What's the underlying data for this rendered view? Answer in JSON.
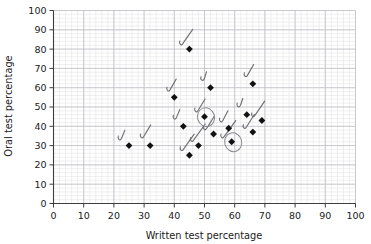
{
  "chart_data": {
    "type": "scatter",
    "title": "",
    "xlabel": "Written test percentage",
    "ylabel": "Oral test percentage",
    "xlim": [
      0,
      100
    ],
    "ylim": [
      0,
      100
    ],
    "xticks": [
      0,
      10,
      20,
      30,
      40,
      50,
      60,
      70,
      80,
      90,
      100
    ],
    "yticks": [
      0,
      10,
      20,
      30,
      40,
      50,
      60,
      70,
      80,
      90,
      100
    ],
    "grid": true,
    "grid_minor": true,
    "minor_step": 2,
    "legend": "none",
    "marker": "filled-diamond",
    "marker_color": "#111111",
    "points": [
      {
        "x": 25,
        "y": 30
      },
      {
        "x": 32,
        "y": 30
      },
      {
        "x": 40,
        "y": 55
      },
      {
        "x": 43,
        "y": 40
      },
      {
        "x": 45,
        "y": 80
      },
      {
        "x": 45,
        "y": 25
      },
      {
        "x": 48,
        "y": 30
      },
      {
        "x": 50,
        "y": 45
      },
      {
        "x": 52,
        "y": 60
      },
      {
        "x": 53,
        "y": 36
      },
      {
        "x": 58,
        "y": 39
      },
      {
        "x": 59,
        "y": 32
      },
      {
        "x": 64,
        "y": 46
      },
      {
        "x": 66,
        "y": 62
      },
      {
        "x": 66,
        "y": 37
      },
      {
        "x": 69,
        "y": 43
      }
    ],
    "annotations": {
      "description": "hand-drawn check marks beside most points; two points circled",
      "check_marks": [
        {
          "x": 25,
          "y": 30
        },
        {
          "x": 32,
          "y": 30
        },
        {
          "x": 40,
          "y": 55
        },
        {
          "x": 43,
          "y": 40
        },
        {
          "x": 45,
          "y": 80
        },
        {
          "x": 45,
          "y": 25
        },
        {
          "x": 48,
          "y": 30
        },
        {
          "x": 50,
          "y": 45
        },
        {
          "x": 52,
          "y": 60
        },
        {
          "x": 53,
          "y": 36
        },
        {
          "x": 58,
          "y": 39
        },
        {
          "x": 59,
          "y": 32
        },
        {
          "x": 64,
          "y": 46
        },
        {
          "x": 66,
          "y": 62
        },
        {
          "x": 66,
          "y": 37
        },
        {
          "x": 69,
          "y": 43
        }
      ],
      "circled": [
        {
          "x": 50,
          "y": 45
        },
        {
          "x": 59,
          "y": 32
        }
      ]
    }
  },
  "axes": {
    "x_title": "Written test percentage",
    "y_title": "Oral test percentage",
    "x_tick_labels": [
      "0",
      "10",
      "20",
      "30",
      "40",
      "50",
      "60",
      "70",
      "80",
      "90",
      "100"
    ],
    "y_tick_labels": [
      "0",
      "10",
      "20",
      "30",
      "40",
      "50",
      "60",
      "70",
      "80",
      "90",
      "100"
    ]
  },
  "colors": {
    "marker": "#111111",
    "grid_major": "#b9b9be",
    "grid_minor": "#e4e4e6",
    "axis": "#3d3d3d",
    "annotation": "#6f6f74",
    "background": "#ffffff"
  }
}
